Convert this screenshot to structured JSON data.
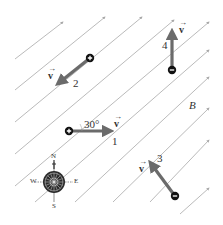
{
  "field": {
    "label": "B",
    "line_color": "#a8a8a8",
    "direction_deg": 38
  },
  "charges": [
    {
      "id": 1,
      "sign": "+",
      "label": "1",
      "velocity_label": "v",
      "angle_label": "30°",
      "direction": "east"
    },
    {
      "id": 2,
      "sign": "+",
      "label": "2",
      "velocity_label": "v",
      "direction": "southwest"
    },
    {
      "id": 3,
      "sign": "−",
      "label": "3",
      "velocity_label": "v",
      "direction": "northwest"
    },
    {
      "id": 4,
      "sign": "−",
      "label": "4",
      "velocity_label": "v",
      "direction": "north"
    }
  ],
  "compass": {
    "north": "N",
    "south": "S",
    "east": "E",
    "west": "W"
  },
  "colors": {
    "arrow": "#6b6b6b",
    "charge": "#111111"
  }
}
